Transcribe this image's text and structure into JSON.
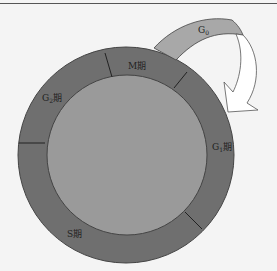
{
  "diagram": {
    "phases": [
      {
        "id": "M",
        "label": "M期"
      },
      {
        "id": "G1",
        "label_main": "G",
        "label_sub": "1",
        "label_suffix": "期"
      },
      {
        "id": "S",
        "label": "S期"
      },
      {
        "id": "G2",
        "label_main": "G",
        "label_sub": "2",
        "label_suffix": "期"
      }
    ],
    "exit_arrow": {
      "label_main": "G",
      "label_sub": "0"
    },
    "colors": {
      "ring": "#6f6f6f",
      "inner": "#9a9a9a",
      "g0_band": "#a8a8a8",
      "arrow_fill": "#ffffff",
      "background": "#f4f4f4"
    }
  }
}
